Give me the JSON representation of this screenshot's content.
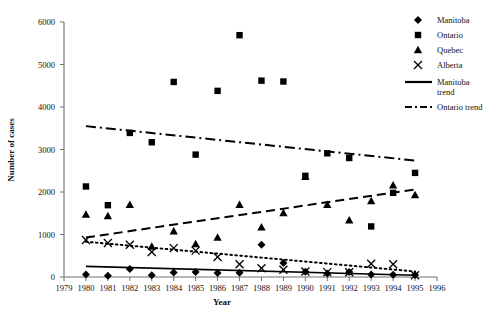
{
  "chart_data": {
    "type": "scatter",
    "title": "",
    "xlabel": "Year",
    "ylabel": "Number of cases",
    "xlim": [
      1979,
      1996
    ],
    "ylim": [
      0,
      6000
    ],
    "grid": false,
    "legend_position": "top-right",
    "x_ticks": [
      1979,
      1980,
      1981,
      1982,
      1983,
      1984,
      1985,
      1986,
      1987,
      1988,
      1989,
      1990,
      1991,
      1992,
      1993,
      1994,
      1995,
      1996
    ],
    "y_ticks": [
      0,
      1000,
      2000,
      3000,
      4000,
      5000,
      6000
    ],
    "x": [
      1980,
      1981,
      1982,
      1983,
      1984,
      1985,
      1986,
      1987,
      1988,
      1989,
      1990,
      1991,
      1992,
      1993,
      1994,
      1995
    ],
    "series": [
      {
        "name": "Manitoba",
        "marker": "diamond",
        "values": [
          60,
          30,
          190,
          40,
          105,
          120,
          95,
          100,
          760,
          330,
          125,
          85,
          120,
          60,
          55,
          50
        ]
      },
      {
        "name": "Ontario",
        "marker": "square",
        "values": [
          2130,
          1690,
          3390,
          3170,
          4590,
          2880,
          4380,
          5690,
          4620,
          4600,
          2380,
          2910,
          2800,
          1190,
          1980,
          2450
        ]
      },
      {
        "name": "Quebec",
        "marker": "triangle",
        "values": [
          1470,
          1440,
          1700,
          720,
          1080,
          780,
          930,
          1700,
          1170,
          1510,
          2360,
          1700,
          1340,
          1790,
          2160,
          1930
        ]
      },
      {
        "name": "Alberta",
        "marker": "cross",
        "values": [
          870,
          800,
          760,
          590,
          680,
          620,
          470,
          300,
          205,
          170,
          130,
          115,
          110,
          310,
          300,
          40
        ]
      }
    ],
    "trends": [
      {
        "name": "Manitoba trend",
        "style": "solid",
        "x": [
          1980,
          1995
        ],
        "values": [
          250,
          40
        ]
      },
      {
        "name": "Ontario trend",
        "style": "dash-dot",
        "x": [
          1980,
          1995
        ],
        "values": [
          3550,
          2740
        ]
      },
      {
        "name": "Quebec trend",
        "style": "dashed",
        "x": [
          1980,
          1995
        ],
        "values": [
          930,
          2060
        ]
      },
      {
        "name": "Alberta trend",
        "style": "dotted",
        "x": [
          1980,
          1995
        ],
        "values": [
          830,
          130
        ]
      }
    ],
    "legend": [
      {
        "label": "Manitoba",
        "symbol": "diamond"
      },
      {
        "label": "Ontario",
        "symbol": "square"
      },
      {
        "label": "Quebec",
        "symbol": "triangle"
      },
      {
        "label": "Alberta",
        "symbol": "cross"
      },
      {
        "label": "Manitoba",
        "label2": "trend",
        "symbol": "solid-line"
      },
      {
        "label": "Ontario trend",
        "symbol": "dashdot-line"
      }
    ]
  }
}
